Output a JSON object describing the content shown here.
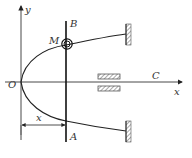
{
  "diagram": {
    "type": "mechanics",
    "labels": {
      "y_axis": "y",
      "x_axis": "x",
      "origin": "O",
      "rod_top": "B",
      "rod_bottom": "A",
      "ring": "M",
      "guide": "C",
      "dimension": "x"
    },
    "colors": {
      "line": "#222222",
      "hatch": "#555555",
      "background": "#ffffff"
    }
  }
}
